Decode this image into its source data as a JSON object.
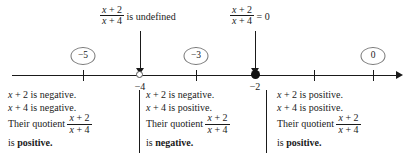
{
  "figure": {
    "expression": {
      "numerator": "x + 2",
      "denominator": "x + 4"
    },
    "callouts": [
      {
        "id": "undefined",
        "numerator": "x + 2",
        "denominator": "x + 4",
        "text": " is undefined",
        "at_value": "-4"
      },
      {
        "id": "zero",
        "numerator": "x + 2",
        "denominator": "x + 4",
        "text": " = 0",
        "at_value": "-2"
      }
    ],
    "number_line": {
      "ticks": [
        {
          "label": "",
          "value": -5
        },
        {
          "label": "",
          "value": -3
        },
        {
          "label": "",
          "value": -1
        },
        {
          "label": "",
          "value": 0
        }
      ],
      "labeled_points": [
        {
          "label": "−4",
          "type": "open-circle",
          "value": -4
        },
        {
          "label": "−2",
          "type": "closed-circle",
          "value": -2
        }
      ],
      "test_values": [
        {
          "label": "−5",
          "value": -5
        },
        {
          "label": "−3",
          "value": -3
        },
        {
          "label": "0",
          "value": 0
        }
      ]
    },
    "analysis_columns": [
      {
        "id": "left",
        "line1_var": "x",
        "line1_rest": " + 2 is negative.",
        "line2_var": "x",
        "line2_rest": " + 4 is negative.",
        "quotient_label": "Their quotient",
        "numerator": "x + 2",
        "denominator": "x + 4",
        "conclusion_prefix": "is ",
        "conclusion": "positive."
      },
      {
        "id": "middle",
        "line1_var": "x",
        "line1_rest": " + 2 is negative.",
        "line2_var": "x",
        "line2_rest": " + 4 is positive.",
        "quotient_label": "Their quotient",
        "numerator": "x + 2",
        "denominator": "x + 4",
        "conclusion_prefix": "is ",
        "conclusion": "negative."
      },
      {
        "id": "right",
        "line1_var": "x",
        "line1_rest": " + 2 is positive.",
        "line2_var": "x",
        "line2_rest": " + 4 is positive.",
        "quotient_label": "Their quotient",
        "numerator": "x + 2",
        "denominator": "x + 4",
        "conclusion_prefix": "is ",
        "conclusion": "positive."
      }
    ],
    "colors": {
      "ink": "#1a1a1a",
      "background": "#ffffff",
      "circle_stroke": "#777777"
    }
  }
}
